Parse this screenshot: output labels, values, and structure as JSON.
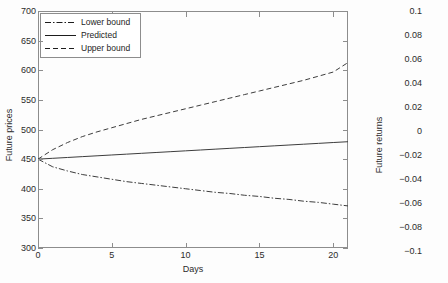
{
  "figures": [
    {
      "id": "future-prices",
      "chart_data": {
        "type": "line",
        "title": "",
        "xlabel": "Days",
        "ylabel": "Future prices",
        "xlim": [
          0,
          21
        ],
        "ylim": [
          300,
          700
        ],
        "xticks": [
          0,
          5,
          10,
          15,
          20
        ],
        "xticklabels": [
          "0",
          "5",
          "10",
          "15",
          "20"
        ],
        "yticks": [
          300,
          350,
          400,
          450,
          500,
          550,
          600,
          650,
          700
        ],
        "yticklabels": [
          "300",
          "350",
          "400",
          "450",
          "500",
          "550",
          "600",
          "650",
          "700"
        ],
        "grid": false,
        "legend_position": "upper left",
        "series": [
          {
            "name": "Lower bound",
            "style": "dash-dot",
            "color": "#3d3d3d",
            "x": [
              0,
              1,
              2,
              3,
              4,
              5,
              6,
              7,
              8,
              9,
              10,
              11,
              12,
              13,
              14,
              15,
              16,
              17,
              18,
              19,
              20,
              21
            ],
            "values": [
              450,
              437,
              430,
              424,
              420,
              416,
              412,
              409,
              406,
              403,
              400,
              397,
              394,
              392,
              389,
              387,
              384,
              382,
              379,
              377,
              374,
              371
            ]
          },
          {
            "name": "Predicted",
            "style": "solid",
            "color": "#3d3d3d",
            "x": [
              0,
              1,
              2,
              3,
              4,
              5,
              6,
              7,
              8,
              9,
              10,
              11,
              12,
              13,
              14,
              15,
              16,
              17,
              18,
              19,
              20,
              21
            ],
            "values": [
              450,
              451.4,
              452.8,
              454.2,
              455.6,
              457,
              458.4,
              459.8,
              461.2,
              462.6,
              464,
              465.4,
              466.8,
              468.2,
              469.6,
              471,
              472.4,
              473.8,
              475.2,
              476.6,
              478,
              479.4
            ]
          },
          {
            "name": "Upper bound",
            "style": "dashed",
            "color": "#3d3d3d",
            "x": [
              0,
              1,
              2,
              3,
              4,
              5,
              6,
              7,
              8,
              9,
              10,
              11,
              12,
              13,
              14,
              15,
              16,
              17,
              18,
              19,
              20,
              21
            ],
            "values": [
              450,
              466,
              478,
              488,
              496,
              503,
              510,
              517,
              523,
              529,
              535,
              541,
              547,
              553,
              559,
              565,
              571,
              577,
              583,
              590,
              597,
              613
            ]
          }
        ]
      },
      "legend": {
        "items": [
          {
            "label": "Lower bound",
            "style": "dash-dot"
          },
          {
            "label": "Predicted",
            "style": "solid"
          },
          {
            "label": "Upper bound",
            "style": "dashed"
          }
        ]
      }
    },
    {
      "id": "future-returns",
      "chart_data": {
        "type": "line",
        "title": "",
        "xlabel": "",
        "ylabel": "Future returns",
        "ylim": [
          -0.1,
          0.1
        ],
        "yticks": [
          0.1,
          0.08,
          0.06,
          0.04,
          0.02,
          0,
          -0.02,
          -0.04,
          -0.06,
          -0.08,
          -0.1
        ],
        "yticklabels": [
          "0.1",
          "0.08",
          "0.06",
          "0.04",
          "0.02",
          "0",
          "−0.02",
          "−0.04",
          "−0.06",
          "−0.08",
          "−0.1"
        ],
        "grid": false,
        "note": "panel cropped at right image edge; only y-axis tick labels and axis title visible",
        "series": []
      }
    }
  ]
}
